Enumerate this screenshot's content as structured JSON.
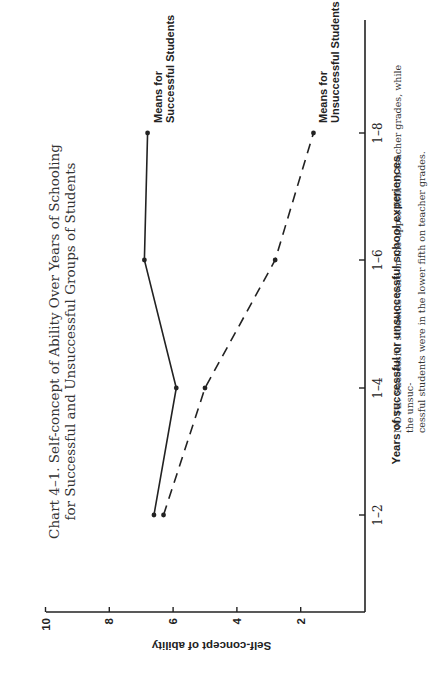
{
  "chart_data": {
    "type": "line",
    "title": "Chart 4–1. Self-concept of Ability Over Years of Schooling for Successful and Unsuccessful Groups of Students",
    "title_lines": [
      "Chart 4–1. Self-concept of Ability Over Years of Schooling",
      "for Successful and Unsuccessful Groups of Students"
    ],
    "xlabel": "Years of successful or unsuccessful school experiences",
    "ylabel": "Self-concept of ability",
    "categories": [
      "1–2",
      "1–4",
      "1–6",
      "1–8"
    ],
    "yticks": [
      "10",
      "8",
      "6",
      "4",
      "2"
    ],
    "ylim": [
      0,
      10
    ],
    "grid": false,
    "orientation": "rotated 90° counter-clockwise on page",
    "series": [
      {
        "name": "Means for Successful Students",
        "label_lines": [
          "Means for",
          "Successful Students"
        ],
        "line_style": "solid",
        "values": [
          6.6,
          5.9,
          6.9,
          6.8
        ]
      },
      {
        "name": "Means for Unsuccessful Students",
        "label_lines": [
          "Means for",
          "Unsuccessful Students"
        ],
        "line_style": "dashed",
        "values": [
          6.3,
          5.0,
          2.8,
          1.6
        ]
      }
    ],
    "note_prefix": "NOTE:",
    "note_line1": "Successful students were in the upper fifth on teacher grades, while the unsuc-",
    "note_line2": "cessful students were in the lower fifth on teacher grades."
  },
  "colors": {
    "ink": "#222222",
    "background": "#ffffff"
  }
}
